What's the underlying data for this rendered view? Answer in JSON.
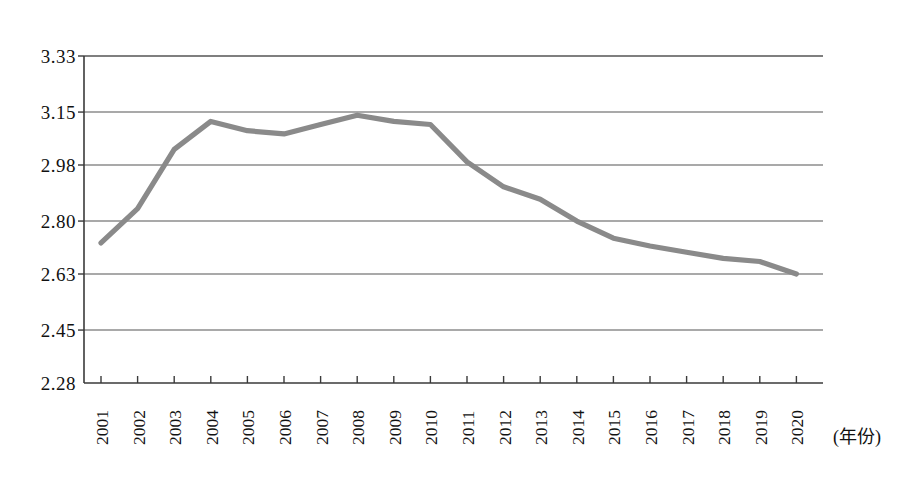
{
  "chart_data": {
    "type": "line",
    "title": "",
    "subtitle": "",
    "xlabel": "(年份)",
    "ylabel": "",
    "categories": [
      "2001",
      "2002",
      "2003",
      "2004",
      "2005",
      "2006",
      "2007",
      "2008",
      "2009",
      "2010",
      "2011",
      "2012",
      "2013",
      "2014",
      "2015",
      "2016",
      "2017",
      "2018",
      "2019",
      "2020"
    ],
    "values": [
      2.73,
      2.84,
      3.03,
      3.12,
      3.09,
      3.08,
      3.11,
      3.14,
      3.12,
      3.11,
      2.99,
      2.91,
      2.87,
      2.8,
      2.745,
      2.72,
      2.7,
      2.68,
      2.67,
      2.63
    ],
    "series": [
      {
        "name": "",
        "values": [
          2.73,
          2.84,
          3.03,
          3.12,
          3.09,
          3.08,
          3.11,
          3.14,
          3.12,
          3.11,
          2.99,
          2.91,
          2.87,
          2.8,
          2.745,
          2.72,
          2.7,
          2.68,
          2.67,
          2.63
        ],
        "color": "#8a8a8a"
      }
    ],
    "ylim": [
      2.28,
      3.33
    ],
    "yticks": [
      3.33,
      3.15,
      2.98,
      2.8,
      2.63,
      2.45,
      2.28
    ],
    "ytick_labels": [
      "3.33",
      "3.15",
      "2.98",
      "2.80",
      "2.63",
      "2.45",
      "2.28"
    ],
    "xtick_labels": [
      "2001",
      "2002",
      "2003",
      "2004",
      "2005",
      "2006",
      "2007",
      "2008",
      "2009",
      "2010",
      "2011",
      "2012",
      "2013",
      "2014",
      "2015",
      "2016",
      "2017",
      "2018",
      "2019",
      "2020"
    ],
    "grid": "horizontal",
    "legend": "none",
    "line_color": "#8a8a8a",
    "axis_color": "#3a3a3a",
    "grid_color": "#555555",
    "background": "#ffffff",
    "annotations": []
  },
  "axis": {
    "x_unit_label": "(年份)"
  }
}
